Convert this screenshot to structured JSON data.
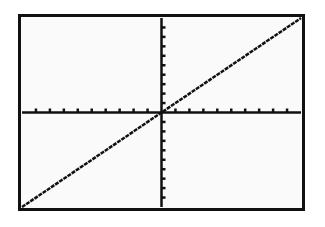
{
  "screen": {
    "type": "graphing-calculator-display",
    "background": "#fafafa",
    "frame_color": "#111111",
    "plot_color": "#111111"
  },
  "chart_data": {
    "type": "line",
    "title": "",
    "xlabel": "",
    "ylabel": "",
    "function": "y = x",
    "series": [
      {
        "name": "Y1",
        "x": [
          -10,
          -5,
          0,
          5,
          10
        ],
        "values": [
          -10,
          -5,
          0,
          5,
          10
        ]
      }
    ],
    "xlim": [
      -10,
      10
    ],
    "ylim": [
      -10,
      10
    ],
    "xscl": 1,
    "yscl": 1,
    "grid": false,
    "axes": true,
    "tick_labels": false,
    "legend": "none"
  }
}
